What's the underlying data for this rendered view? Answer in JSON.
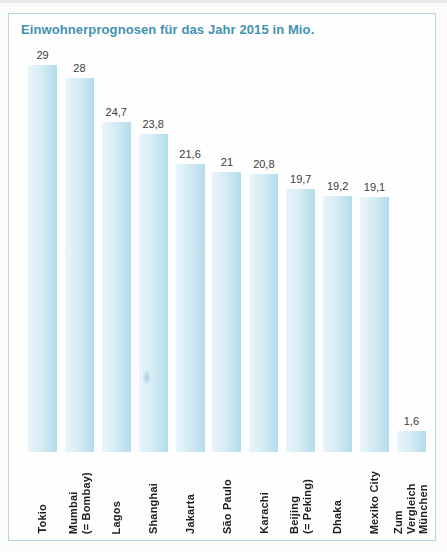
{
  "chart_data": {
    "type": "bar",
    "title": "Einwohnerprognosen für das Jahr 2015 in Mio.",
    "categories": [
      "Tokio",
      "Mumbai\n(= Bombay)",
      "Lagos",
      "Shanghai",
      "Jakarta",
      "São Paulo",
      "Karachi",
      "Beijing\n(= Peking)",
      "Dhaka",
      "Mexiko City",
      "Zum Vergleich\nMünchen"
    ],
    "values": [
      29,
      28,
      24.7,
      23.8,
      21.6,
      21,
      20.8,
      19.7,
      19.2,
      19.1,
      1.6
    ],
    "value_labels": [
      "29",
      "28",
      "24,7",
      "23,8",
      "21,6",
      "21",
      "20,8",
      "19,7",
      "19,2",
      "19,1",
      "1,6"
    ],
    "xlabel": "",
    "ylabel": "",
    "ylim": [
      0,
      29
    ],
    "grid": false,
    "legend": "none",
    "orientation": "vertical-bars",
    "category_label_rotation_deg": 90,
    "decimal_separator": ","
  },
  "colors": {
    "title": "#4292b0",
    "frame_border": "#b2d7e4",
    "bar_gradient_left": "#eaf5fa",
    "bar_gradient_mid": "#d6ecf4",
    "bar_gradient_right": "#b3dcea",
    "value_text": "#3c3c3b",
    "category_text": "#1d1d1b"
  }
}
